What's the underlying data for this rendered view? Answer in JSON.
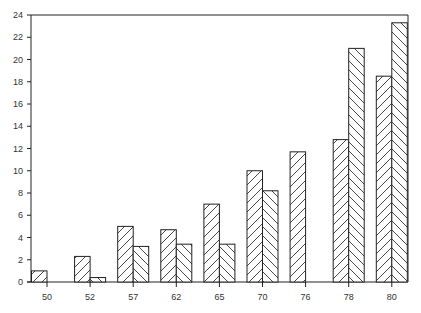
{
  "chart_data": {
    "type": "bar",
    "title": "",
    "xlabel": "",
    "ylabel": "",
    "categories": [
      "50",
      "52",
      "57",
      "62",
      "65",
      "70",
      "76",
      "78",
      "80"
    ],
    "series": [
      {
        "name": "series-1",
        "hatch": "forward-diagonal",
        "values": [
          1.0,
          2.3,
          5.0,
          4.7,
          7.0,
          10.0,
          11.7,
          12.8,
          18.5
        ]
      },
      {
        "name": "series-2",
        "hatch": "back-diagonal",
        "values": [
          0,
          0.4,
          3.2,
          3.4,
          3.4,
          8.2,
          0,
          21.0,
          23.3
        ]
      }
    ],
    "ylim": [
      0,
      24
    ],
    "yticks": [
      0,
      2,
      4,
      6,
      8,
      10,
      12,
      14,
      16,
      18,
      20,
      22,
      24
    ],
    "grid": false,
    "legend": null,
    "colors": {
      "stroke": "#222222",
      "background": "#ffffff",
      "text": "#333333"
    }
  }
}
